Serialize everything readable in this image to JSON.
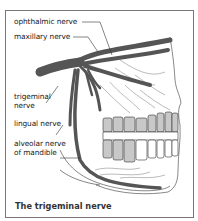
{
  "figure": {
    "caption": "The trigeminal nerve",
    "labels": {
      "ophthalmic": "ophthalmic nerve",
      "maxillary": "maxillary nerve",
      "trigeminal_1": "trigeminal",
      "trigeminal_2": "nerve",
      "lingual": "lingual nerve",
      "alveolar_1": "alveolar nerve",
      "alveolar_2": "of mandible"
    },
    "colors": {
      "nerve": "#555555",
      "tooth_shade": "#c8c8c8",
      "outline": "#333333",
      "frame": "#777777"
    }
  }
}
